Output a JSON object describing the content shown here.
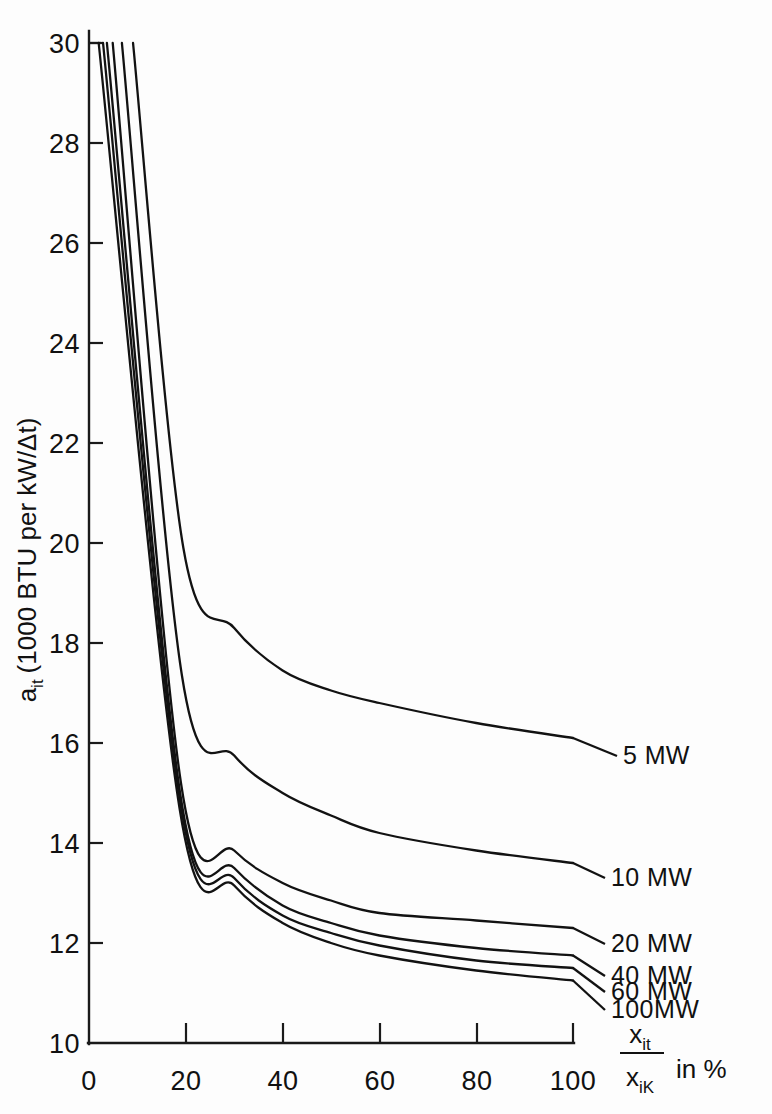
{
  "chart_data": {
    "type": "line",
    "title": "",
    "subtitle": "",
    "xlabel": "x_it / x_iK in %",
    "xlabel_parts": {
      "numerator": "x",
      "numerator_sub": "it",
      "denominator": "x",
      "denominator_sub": "iK",
      "suffix": "in %"
    },
    "ylabel": "a_it (1000 BTU per kW/Δt)",
    "ylabel_parts": {
      "symbol": "a",
      "symbol_sub": "it",
      "rest": "(1000 BTU per kW/Δt)"
    },
    "xlim": [
      0,
      100
    ],
    "ylim": [
      10,
      30
    ],
    "xticks": [
      0,
      20,
      40,
      60,
      80,
      100
    ],
    "xticklabels": [
      "0",
      "20",
      "40",
      "60",
      "80",
      "100"
    ],
    "yticks": [
      10,
      12,
      14,
      16,
      18,
      20,
      22,
      24,
      26,
      28,
      30
    ],
    "yticklabels": [
      "10",
      "12",
      "14",
      "16",
      "18",
      "20",
      "22",
      "24",
      "26",
      "28",
      "30"
    ],
    "grid": false,
    "legend_position": "right-inline-labels",
    "line_color": "#121212",
    "background_color": "#fdfdfd",
    "series": [
      {
        "name": "5 MW",
        "label": "5 MW",
        "x": [
          9.1,
          19.5,
          30.0,
          40.0,
          50.0,
          60.0,
          80.0,
          100.0
        ],
        "y": [
          30.0,
          19.9,
          18.3,
          17.45,
          17.05,
          16.8,
          16.4,
          16.1
        ]
      },
      {
        "name": "10 MW",
        "label": "10 MW",
        "x": [
          6.8,
          19.2,
          30.0,
          40.0,
          50.0,
          60.0,
          80.0,
          100.0
        ],
        "y": [
          30.0,
          17.35,
          15.75,
          15.0,
          14.55,
          14.2,
          13.85,
          13.6
        ]
      },
      {
        "name": "20 MW",
        "label": "20 MW",
        "x": [
          4.9,
          19.0,
          30.0,
          40.0,
          50.0,
          60.0,
          80.0,
          100.0
        ],
        "y": [
          30.0,
          15.2,
          13.85,
          13.2,
          12.85,
          12.6,
          12.45,
          12.3
        ]
      },
      {
        "name": "40 MW",
        "label": "40 MW",
        "x": [
          3.7,
          18.9,
          30.0,
          40.0,
          50.0,
          60.0,
          80.0,
          100.0
        ],
        "y": [
          30.0,
          14.95,
          13.5,
          12.75,
          12.4,
          12.15,
          11.9,
          11.75
        ]
      },
      {
        "name": "60 MW",
        "label": "60 MW",
        "x": [
          2.9,
          18.8,
          30.0,
          40.0,
          50.0,
          60.0,
          80.0,
          100.0
        ],
        "y": [
          30.0,
          14.85,
          13.3,
          12.55,
          12.2,
          11.95,
          11.65,
          11.5
        ]
      },
      {
        "name": "100 MW",
        "label": "100MW",
        "x": [
          2.0,
          18.7,
          30.0,
          40.0,
          50.0,
          60.0,
          80.0,
          100.0
        ],
        "y": [
          30.0,
          14.7,
          13.15,
          12.4,
          12.0,
          11.75,
          11.45,
          11.25
        ]
      }
    ],
    "annotations": [
      {
        "text": "5 MW",
        "anchor_x": 100,
        "anchor_y": 16.1,
        "label_px_x": 623,
        "label_px_y": 764
      },
      {
        "text": "10 MW",
        "anchor_x": 100,
        "anchor_y": 13.6,
        "label_px_x": 611,
        "label_px_y": 886
      },
      {
        "text": "20 MW",
        "anchor_x": 100,
        "anchor_y": 12.3,
        "label_px_x": 611,
        "label_px_y": 952
      },
      {
        "text": "40 MW",
        "anchor_x": 100,
        "anchor_y": 11.75,
        "label_px_x": 611,
        "label_px_y": 984
      },
      {
        "text": "60 MW",
        "anchor_x": 100,
        "anchor_y": 11.5,
        "label_px_x": 611,
        "label_px_y": 1000
      },
      {
        "text": "100MW",
        "anchor_x": 100,
        "anchor_y": 11.25,
        "label_px_x": 611,
        "label_px_y": 1018
      }
    ]
  }
}
